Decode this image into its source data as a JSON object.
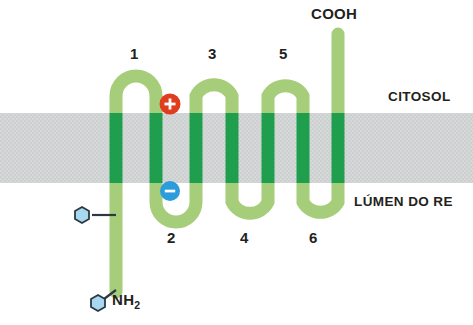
{
  "figure": {
    "type": "biological-diagram",
    "compartments": {
      "upper_label": "CITOSOL",
      "lower_label": "LÚMEN DO RE"
    },
    "termini": {
      "n_terminus_label": "NH",
      "n_terminus_subscript": "2",
      "c_terminus_label": "COOH"
    },
    "helix_numbers": {
      "top": [
        "1",
        "3",
        "5"
      ],
      "bottom": [
        "2",
        "4",
        "6"
      ]
    },
    "charges": [
      {
        "name": "positive-charge",
        "glyph": "+",
        "color": "#e03c1f",
        "side": "cytosol"
      },
      {
        "name": "negative-charge",
        "glyph": "–",
        "color": "#2d9cdb",
        "side": "lumen"
      }
    ],
    "glycosylation_sites": [
      {
        "name": "glycan-hexagon-upper",
        "shape": "hexagon",
        "color": "#a8d8f0"
      },
      {
        "name": "glycan-hexagon-lower",
        "shape": "hexagon",
        "color": "#a8d8f0"
      }
    ],
    "colors": {
      "chain_light_green": "#a6ce7a",
      "chain_dark_green": "#1f9e4e",
      "membrane_gray": "#d4d6d6",
      "background": "#ffffff",
      "text": "#231f20",
      "hexagon_fill": "#a8d8f0",
      "hexagon_stroke": "#2b3a42"
    },
    "membrane": {
      "top_y": 113,
      "bottom_y": 183,
      "transmembrane_segment_count": 7
    }
  }
}
